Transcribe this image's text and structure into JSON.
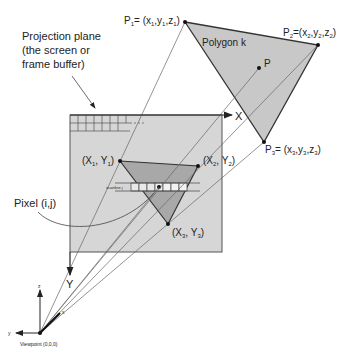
{
  "labels": {
    "projection_plane_1": "Projection plane",
    "projection_plane_2": "(the screen or",
    "projection_plane_3": "frame buffer)",
    "polygon": "Polygon k",
    "p1": "P",
    "p1_sub": "1",
    "p1_rest": "= (x",
    "p1_full": "P1= (x1,y1,z1)",
    "p2_full": "P2=(x2,y2,z2)",
    "p3_full": "P3= (x3,y3,z3)",
    "p": "P",
    "x_axis": "X",
    "y_axis": "Y",
    "v1": "(X1, Y1)",
    "v2": "(X2, Y2)",
    "v3": "(X3, Y3)",
    "scanline": "scanline j",
    "pixel": "Pixel (i,j)",
    "viewpoint": "Viewpoint (0,0,0)",
    "view_z": "z",
    "view_y": "y",
    "view_x": "x"
  },
  "colors": {
    "polygon_fill": "#c8c8c8",
    "plane_fill": "#d6d6d6",
    "projected_fill": "#a8a8a8",
    "line": "#333333",
    "ray": "#555555"
  }
}
